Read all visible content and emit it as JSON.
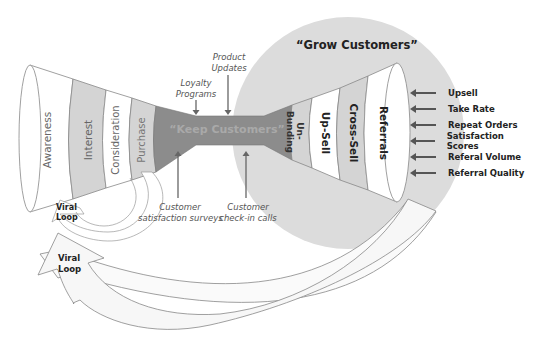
{
  "diagram": {
    "title_grow": "“Grow Customers”",
    "title_keep": "“Keep Customers”",
    "colors": {
      "circle_fill": "#dcdcdc",
      "keep_band": "#8c8c8c",
      "keep_text": "#a9a9a9",
      "stage_light": "#ffffff",
      "stage_shaded": "#d4d4d4",
      "outline": "#777777",
      "arrow": "#555555"
    },
    "acquisition_funnel": {
      "stages": [
        {
          "label": "Awareness",
          "shade": "light"
        },
        {
          "label": "Interest",
          "shade": "shaded"
        },
        {
          "label": "Consideration",
          "shade": "light"
        },
        {
          "label": "Purchase",
          "shade": "shaded"
        }
      ]
    },
    "growth_funnel": {
      "stages": [
        {
          "label": "Un-Bunding",
          "line1": "Un-",
          "line2": "Bunding",
          "shade": "shaded"
        },
        {
          "label": "Up-Sell",
          "shade": "light"
        },
        {
          "label": "Cross-Sell",
          "shade": "shaded"
        },
        {
          "label": "Referrals",
          "shade": "light"
        }
      ]
    },
    "keep_inputs_top": [
      {
        "line1": "Loyalty",
        "line2": "Programs"
      },
      {
        "line1": "Product",
        "line2": "Updates"
      }
    ],
    "keep_inputs_bottom": [
      {
        "line1": "Customer",
        "line2": "satisfaction surveys"
      },
      {
        "line1": "Customer",
        "line2": "check-in calls"
      }
    ],
    "metrics": [
      "Upsell",
      "Take Rate",
      "Repeat Orders",
      "Satisfaction Scores",
      "Referal Volume",
      "Referral Quality"
    ],
    "viral_loops": [
      {
        "line1": "Viral",
        "line2": "Loop",
        "size": "small"
      },
      {
        "line1": "Viral",
        "line2": "Loop",
        "size": "large"
      }
    ]
  }
}
